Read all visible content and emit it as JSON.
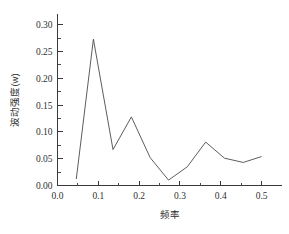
{
  "chart_data": {
    "type": "line",
    "title": "",
    "xlabel": "频率",
    "ylabel": "波动强度(w)",
    "xlim": [
      0.0,
      0.55
    ],
    "ylim": [
      0.0,
      0.32
    ],
    "grid": false,
    "legend": null,
    "x_ticks_major": [
      "0.0",
      "0.1",
      "0.2",
      "0.3",
      "0.4",
      "0.5"
    ],
    "x_ticks_major_values": [
      0.0,
      0.1,
      0.2,
      0.3,
      0.4,
      0.5
    ],
    "x_ticks_minor_values": [
      0.05,
      0.15,
      0.25,
      0.35,
      0.45
    ],
    "y_ticks_major": [
      "0.00",
      "0.05",
      "0.10",
      "0.15",
      "0.20",
      "0.25",
      "0.30"
    ],
    "y_ticks_major_values": [
      0.0,
      0.05,
      0.1,
      0.15,
      0.2,
      0.25,
      0.3
    ],
    "y_ticks_minor_values": [
      0.025,
      0.075,
      0.125,
      0.175,
      0.225,
      0.275
    ],
    "series": [
      {
        "name": "波动强度",
        "x": [
          0.046,
          0.088,
          0.136,
          0.181,
          0.227,
          0.272,
          0.318,
          0.363,
          0.409,
          0.455,
          0.5
        ],
        "y": [
          0.012,
          0.273,
          0.067,
          0.128,
          0.052,
          0.01,
          0.035,
          0.081,
          0.051,
          0.043,
          0.054
        ]
      }
    ],
    "line_color": "#4b4b4b",
    "axis_color": "#3a3a3a"
  },
  "axis_titles": {
    "x": "频率",
    "y": "波动强度(w)"
  }
}
